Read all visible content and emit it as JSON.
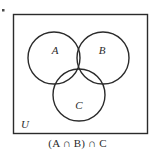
{
  "figure": {
    "type": "venn-diagram",
    "sets": [
      "A",
      "B",
      "C"
    ],
    "universe_label": "U",
    "caption": "(A ∩ B) ∩ C",
    "shaded_region": "A ∩ B ∩ C",
    "labels": {
      "set_a": "A",
      "set_b": "B",
      "set_c": "C",
      "universe": "U"
    },
    "colors": {
      "stroke": "#2b2b2b",
      "shade": "#c9c9c9",
      "background": "#ffffff",
      "text": "#2b2b2b"
    },
    "geometry": {
      "universe_rect": [
        13,
        14,
        135,
        120
      ],
      "circle_radius": 26,
      "circle_a_center": [
        54,
        58
      ],
      "circle_b_center": [
        103,
        58
      ],
      "circle_c_center": [
        79,
        95
      ]
    },
    "marker": "bullet-dot"
  }
}
